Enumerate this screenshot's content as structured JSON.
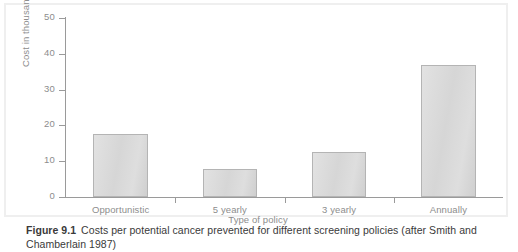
{
  "figure": {
    "number": "Figure 9.1",
    "caption": "Costs per potential cancer prevented for different screening policies (after Smith and Chamberlain 1987)"
  },
  "chart_data": {
    "type": "bar",
    "title": "",
    "categories": [
      "Opportunistic",
      "5 yearly",
      "3 yearly",
      "Annually"
    ],
    "values": [
      17.5,
      7.8,
      12.5,
      37.0
    ],
    "xlabel": "Type of policy",
    "ylabel": "Cost in thousands",
    "ylim": [
      0,
      50
    ],
    "yticks": [
      0,
      10,
      20,
      30,
      40,
      50
    ],
    "ytick_labels": [
      "0",
      "10",
      "20",
      "30",
      "40",
      "50"
    ],
    "grid": false,
    "legend": null,
    "bar_fill_color": "#dcdcdc",
    "bar_border_color": "#b4b4b4",
    "axis_color": "#9a9a9a",
    "tick_label_color": "#8d8d8d"
  }
}
